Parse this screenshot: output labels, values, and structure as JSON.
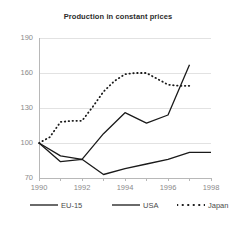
{
  "chart_data": {
    "type": "line",
    "title": "Production in constant prices",
    "xlabel": "",
    "ylabel": "",
    "xlim": [
      1990,
      1998
    ],
    "ylim": [
      70,
      190
    ],
    "xticks": [
      1990,
      1992,
      1994,
      1996,
      1998
    ],
    "yticks": [
      70,
      100,
      130,
      160,
      190
    ],
    "grid": true,
    "legend_position": "bottom",
    "series": [
      {
        "name": "EU-15",
        "style": "solid",
        "color": "#1a1a1a",
        "x": [
          1990,
          1991,
          1992,
          1993,
          1994,
          1995,
          1996,
          1997,
          1998
        ],
        "values": [
          100,
          84,
          86,
          73,
          78,
          82,
          86,
          92,
          92
        ]
      },
      {
        "name": "USA",
        "style": "solid",
        "color": "#1a1a1a",
        "x": [
          1990,
          1991,
          1992,
          1993,
          1994,
          1995,
          1996,
          1997
        ],
        "values": [
          100,
          89,
          86,
          108,
          126,
          117,
          124,
          167
        ]
      },
      {
        "name": "Japan",
        "style": "dashed",
        "color": "#1a1a1a",
        "x": [
          1990,
          1990.5,
          1991,
          1991.5,
          1992,
          1992.5,
          1993,
          1993.5,
          1994,
          1994.5,
          1995,
          1995.5,
          1996,
          1996.5,
          1997
        ],
        "values": [
          100,
          105,
          118,
          119,
          119,
          131,
          144,
          153,
          159,
          160,
          160,
          155,
          150,
          149,
          149
        ]
      }
    ]
  },
  "axis": {
    "ytick_labels": [
      "190",
      "160",
      "130",
      "100",
      "70"
    ],
    "xtick_labels": [
      "1990",
      "1992",
      "1994",
      "1996",
      "1998"
    ]
  },
  "legend": {
    "items": [
      {
        "label": "EU-15",
        "style": "solid"
      },
      {
        "label": "USA",
        "style": "solid"
      },
      {
        "label": "Japan",
        "style": "dashed"
      }
    ]
  },
  "colors": {
    "line": "#1a1a1a",
    "grid": "#e2e2e2",
    "axis": "#b8b8b8",
    "tick_text": "#8a8a8a",
    "title_text": "#2b2b2b",
    "background": "#ffffff"
  }
}
